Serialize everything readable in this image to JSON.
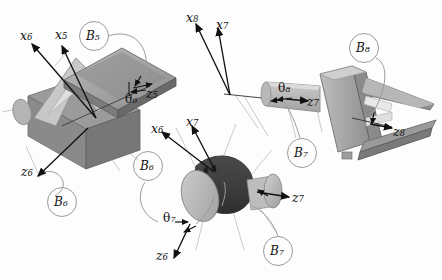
{
  "figure": {
    "background_color": "#fdfdfd",
    "stroke_color": "#111111",
    "leader_color": "#9b9b9b",
    "palette": {
      "light_gray": "#d0d0d0",
      "mid_gray": "#a8a8a8",
      "dark_gray": "#8a8a8a",
      "darker_gray": "#6e6e6e",
      "very_dark": "#3a3a3a",
      "pale": "#e3e3e3"
    }
  },
  "assemblies": [
    {
      "id": "wedge-assembly",
      "name": "B5-B6 wedge joint",
      "bodies": [
        "B5",
        "B6"
      ],
      "axes": [
        "x6",
        "x5",
        "z5",
        "z6"
      ],
      "angle": "theta6"
    },
    {
      "id": "cylinder-assembly",
      "name": "B6-B7 cylinder joint",
      "bodies": [
        "B6",
        "B7"
      ],
      "axes": [
        "x6",
        "x7",
        "z7",
        "z6"
      ],
      "angle": "theta7"
    },
    {
      "id": "gripper-assembly",
      "name": "B7-B8 gripper joint",
      "bodies": [
        "B7",
        "B8"
      ],
      "axes": [
        "x8",
        "x7",
        "z7",
        "z8"
      ],
      "angle": "theta8"
    }
  ],
  "labels": {
    "x6_left": {
      "base": "x",
      "sub": "6"
    },
    "x5_left": {
      "base": "x",
      "sub": "5"
    },
    "z5_left": {
      "base": "z",
      "sub": "5"
    },
    "z6_left": {
      "base": "z",
      "sub": "6"
    },
    "theta6": {
      "base": "θ",
      "sub": "6"
    },
    "B5": {
      "base": "B",
      "sub": "5"
    },
    "B6_left": {
      "base": "B",
      "sub": "6"
    },
    "x6_mid": {
      "base": "x",
      "sub": "6"
    },
    "x7_mid": {
      "base": "x",
      "sub": "7"
    },
    "z7_mid": {
      "base": "z",
      "sub": "7"
    },
    "z6_mid": {
      "base": "z",
      "sub": "6"
    },
    "theta7": {
      "base": "θ",
      "sub": "7"
    },
    "B6_mid": {
      "base": "B",
      "sub": "6"
    },
    "B7_mid": {
      "base": "B",
      "sub": "7"
    },
    "x8_right": {
      "base": "x",
      "sub": "8"
    },
    "x7_right": {
      "base": "x",
      "sub": "7"
    },
    "z7_right": {
      "base": "z",
      "sub": "7"
    },
    "z8_right": {
      "base": "z",
      "sub": "8"
    },
    "theta8": {
      "base": "θ",
      "sub": "8"
    },
    "B7_right": {
      "base": "B",
      "sub": "7"
    },
    "B8_right": {
      "base": "B",
      "sub": "8"
    }
  }
}
